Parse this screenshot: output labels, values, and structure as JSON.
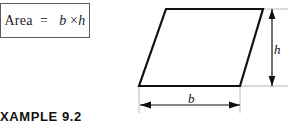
{
  "figure": {
    "type": "geometry-diagram",
    "shape": "parallelogram",
    "formula_box": {
      "label_area": "Area",
      "equals": "=",
      "base_symbol": "b",
      "times_symbol": "×",
      "height_symbol": "h",
      "full_text": "Area  =   b × h",
      "border_color": "#5c5c5c"
    },
    "dimensions": [
      {
        "name": "height",
        "label": "h",
        "orientation": "vertical",
        "arrowheads": "both"
      },
      {
        "name": "base",
        "label": "b",
        "orientation": "horizontal",
        "arrowheads": "both"
      }
    ],
    "caption": "XAMPLE 9.2",
    "colors": {
      "outline": "#111111",
      "extension_line": "#9a9a9a",
      "background": "#ffffff",
      "text": "#111111"
    },
    "parallelogram_vertices": [
      [
        166,
        9
      ],
      [
        263,
        9
      ],
      [
        240,
        86
      ],
      [
        139,
        86
      ]
    ]
  }
}
